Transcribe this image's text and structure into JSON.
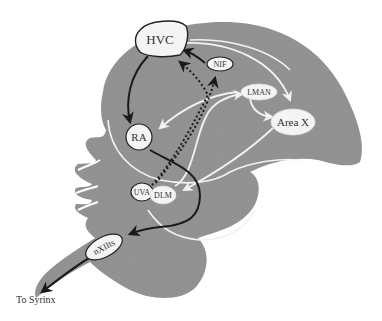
{
  "diagram": {
    "type": "songbird-brain-song-system",
    "colors": {
      "brain_fill": "#8f8f8f",
      "node_fill": "#f4f4f4",
      "node_stroke": "#222222",
      "motor_pathway": "#1a1a1a",
      "afp_pathway": "#f2f2f2",
      "background": "#ffffff"
    },
    "nodes": [
      {
        "id": "HVC",
        "label": "HVC"
      },
      {
        "id": "NIF",
        "label": "NIF"
      },
      {
        "id": "LMAN",
        "label": "LMAN"
      },
      {
        "id": "AreaX",
        "label": "Area X"
      },
      {
        "id": "RA",
        "label": "RA"
      },
      {
        "id": "UVA",
        "label": "UVA"
      },
      {
        "id": "DLM",
        "label": "DLM"
      },
      {
        "id": "nXIIts",
        "label": "nXIIts"
      }
    ],
    "connections": [
      {
        "from": "HVC",
        "to": "RA",
        "style": "solid-black"
      },
      {
        "from": "RA",
        "to": "nXIIts",
        "style": "solid-black"
      },
      {
        "from": "nXIIts",
        "to": "To Syrinx",
        "style": "solid-black"
      },
      {
        "from": "NIF",
        "to": "HVC",
        "style": "solid-black"
      },
      {
        "from": "UVA",
        "to": "HVC",
        "style": "dotted-black"
      },
      {
        "from": "UVA",
        "to": "NIF",
        "style": "dotted-black"
      },
      {
        "from": "HVC",
        "to": "Area X",
        "style": "solid-white"
      },
      {
        "from": "LMAN",
        "to": "Area X",
        "style": "solid-white"
      },
      {
        "from": "LMAN",
        "to": "RA",
        "style": "solid-white"
      },
      {
        "from": "Area X",
        "to": "DLM",
        "style": "solid-white"
      },
      {
        "from": "DLM",
        "to": "LMAN",
        "style": "solid-white"
      }
    ],
    "output_label": "To Syrinx"
  }
}
